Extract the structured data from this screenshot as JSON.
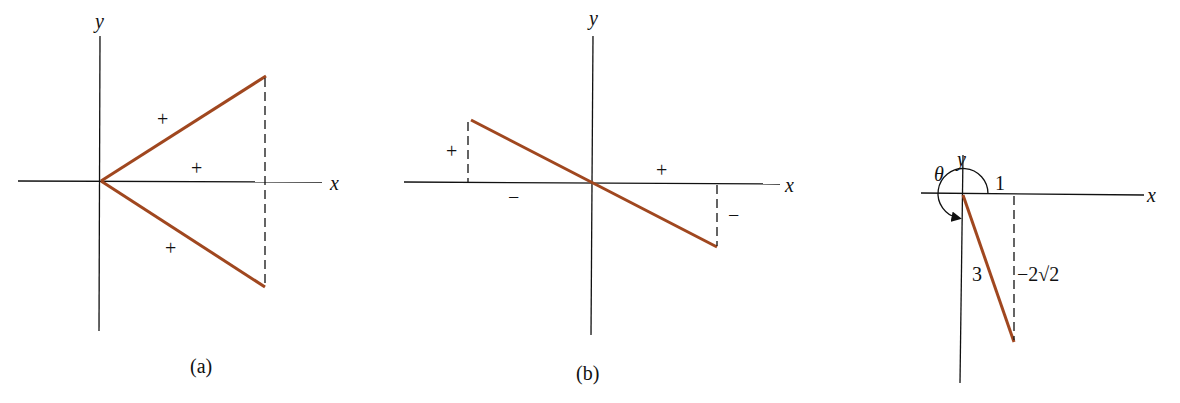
{
  "colors": {
    "axis": "#111111",
    "segment": "#a0471f",
    "dash": "#111111"
  },
  "panels": [
    {
      "id": "a",
      "caption": "(a)",
      "x_label": "x",
      "y_label": "y",
      "signs": {
        "upper_segment": "+",
        "base": "+",
        "lower_segment": "+"
      }
    },
    {
      "id": "b",
      "caption": "(b)",
      "x_label": "x",
      "y_label": "y",
      "signs": {
        "left_height": "+",
        "left_base": "−",
        "right_base": "+",
        "right_height": "−"
      }
    },
    {
      "id": "c",
      "x_label": "x",
      "y_label": "y",
      "angle_label": "θ",
      "x_value": "1",
      "hypotenuse": "3",
      "y_value": "−2√2"
    }
  ]
}
